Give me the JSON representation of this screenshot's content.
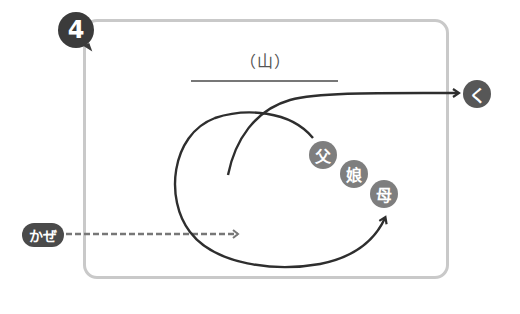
{
  "step": {
    "number": "4"
  },
  "diagram": {
    "title": "（山）",
    "start_label": "かぜ",
    "end_label": "く",
    "nodes": [
      {
        "id": "father",
        "label": "父"
      },
      {
        "id": "daughter",
        "label": "娘"
      },
      {
        "id": "mother",
        "label": "母"
      }
    ]
  },
  "colors": {
    "frame_border": "#c9c9c9",
    "badge_dark": "#3b3b3b",
    "node_fill": "#7e7e7e",
    "path_stroke": "#2e2e2e",
    "dashed_stroke": "#777777"
  }
}
